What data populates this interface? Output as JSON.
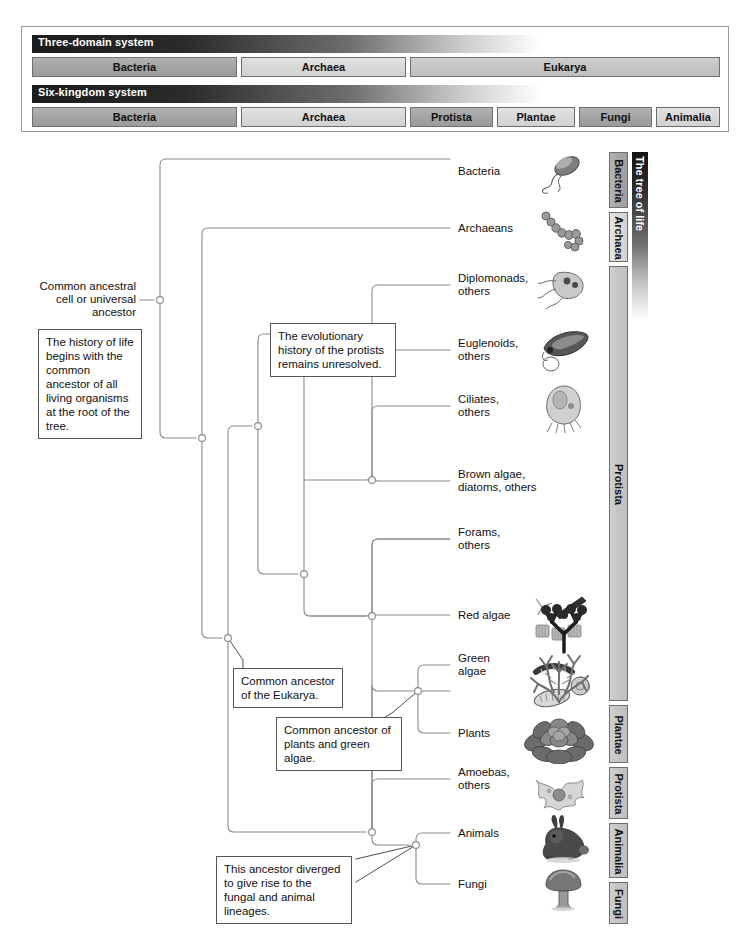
{
  "classification": {
    "systems": [
      {
        "id": "three-domain",
        "title": "Three-domain system",
        "groups": [
          {
            "label": "Bacteria",
            "tone": "dark",
            "left": 0,
            "width": 205
          },
          {
            "label": "Archaea",
            "tone": "light",
            "left": 209,
            "width": 165
          },
          {
            "label": "Eukarya",
            "tone": "mid",
            "left": 378,
            "width": 310
          }
        ]
      },
      {
        "id": "six-kingdom",
        "title": "Six-kingdom system",
        "groups": [
          {
            "label": "Bacteria",
            "tone": "dark",
            "left": 0,
            "width": 205
          },
          {
            "label": "Archaea",
            "tone": "light",
            "left": 209,
            "width": 165
          },
          {
            "label": "Protista",
            "tone": "dark",
            "left": 378,
            "width": 83
          },
          {
            "label": "Plantae",
            "tone": "light",
            "left": 465,
            "width": 78
          },
          {
            "label": "Fungi",
            "tone": "dark",
            "left": 547,
            "width": 73
          },
          {
            "label": "Animalia",
            "tone": "light",
            "left": 624,
            "width": 64
          }
        ]
      }
    ]
  },
  "tree": {
    "root_label": "Common ancestral\ncell or universal\nancestor",
    "leaves": [
      {
        "id": "bacteria",
        "label": "Bacteria",
        "y": 170,
        "organism": "bacterium-icon"
      },
      {
        "id": "archaeans",
        "label": "Archaeans",
        "y": 228,
        "organism": "archaean-chain-icon"
      },
      {
        "id": "diplomonads",
        "label": "Diplomonads,\nothers",
        "y": 285,
        "organism": "diplomonad-icon"
      },
      {
        "id": "euglenoids",
        "label": "Euglenoids,\nothers",
        "y": 350,
        "organism": "euglenoid-icon"
      },
      {
        "id": "ciliates",
        "label": "Ciliates,\nothers",
        "y": 418,
        "organism": "ciliate-icon"
      },
      {
        "id": "brown-algae",
        "label": "Brown algae,\ndiatoms, others",
        "y": 481,
        "organism": "diatom-icon"
      },
      {
        "id": "forams",
        "label": "Forams,\nothers",
        "y": 551,
        "organism": "foram-icon"
      },
      {
        "id": "red-algae",
        "label": "Red algae",
        "y": 615,
        "organism": "red-algae-icon"
      },
      {
        "id": "green-algae",
        "label": "Green\nalgae",
        "y": 677,
        "organism": "green-algae-icon"
      },
      {
        "id": "plants",
        "label": "Plants",
        "y": 733,
        "organism": "plant-icon"
      },
      {
        "id": "amoebas",
        "label": "Amoebas,\nothers",
        "y": 791,
        "organism": "amoeba-icon"
      },
      {
        "id": "animals",
        "label": "Animals",
        "y": 845,
        "organism": "rabbit-icon"
      },
      {
        "id": "fungi",
        "label": "Fungi",
        "y": 884,
        "organism": "mushroom-icon"
      }
    ],
    "notes": [
      {
        "id": "root-note",
        "text": "The history of life begins with the common ancestor of all living organisms at the root of the tree.",
        "x": 38,
        "y": 329,
        "width": 104
      },
      {
        "id": "protist-note",
        "text": "The evolutionary history of the protists remains unresolved.",
        "x": 270,
        "y": 323,
        "width": 126
      },
      {
        "id": "eukarya-note",
        "text": "Common ancestor of the Eukarya.",
        "x": 233,
        "y": 668,
        "width": 110
      },
      {
        "id": "plants-algae-note",
        "text": "Common ancestor of plants and green algae.",
        "x": 276,
        "y": 717,
        "width": 126
      },
      {
        "id": "fungal-animal-note",
        "text": "This ancestor diverged to give rise to the fungal and animal lineages.",
        "x": 216,
        "y": 856,
        "width": 136
      }
    ]
  },
  "rail": {
    "title": "The tree of life",
    "bars": [
      {
        "label": "Bacteria",
        "tone": "dark",
        "top": 152,
        "height": 56
      },
      {
        "label": "Archaea",
        "tone": "light",
        "top": 212,
        "height": 50
      },
      {
        "label": "Protista",
        "tone": "mid",
        "top": 266,
        "height": 435
      },
      {
        "label": "Plantae",
        "tone": "mid",
        "top": 705,
        "height": 58
      },
      {
        "label": "Protista",
        "tone": "mid",
        "top": 767,
        "height": 52
      },
      {
        "label": "Animalia",
        "tone": "mid",
        "top": 823,
        "height": 55
      },
      {
        "label": "Fungi",
        "tone": "mid",
        "top": 882,
        "height": 42
      }
    ]
  },
  "colors": {
    "line": "#8a8a8a",
    "node_stroke": "#8a8a8a",
    "node_fill": "#ffffff",
    "panel_border": "#9a9a9a",
    "bar_border": "#6e6e6e",
    "text": "#111111"
  }
}
